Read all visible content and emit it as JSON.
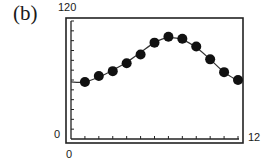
{
  "panel": {
    "label": "(b)"
  },
  "axes": {
    "y_max_label": "120",
    "y_min_label": "0",
    "x_min_label": "0",
    "x_max_label": "12"
  },
  "chart_data": {
    "type": "scatter",
    "title": "(b)",
    "xlabel": "",
    "ylabel": "",
    "xlim": [
      0,
      12
    ],
    "ylim": [
      0,
      120
    ],
    "grid": false,
    "legend": null,
    "x_ticks": [
      0,
      1,
      2,
      3,
      4,
      5,
      6,
      7,
      8,
      9,
      10,
      11,
      12
    ],
    "y_ticks_count": 12,
    "series": [
      {
        "name": "data",
        "marker": "filled-circle",
        "x": [
          1,
          2,
          3,
          4,
          5,
          6,
          7,
          8,
          9,
          10,
          11,
          12
        ],
        "values": [
          58,
          64,
          69,
          77,
          86,
          98,
          104,
          102,
          94,
          81,
          68,
          60
        ]
      },
      {
        "name": "fitted curve",
        "style": "line",
        "x": [
          0,
          1,
          2,
          3,
          4,
          5,
          6,
          7,
          8,
          9,
          10,
          11,
          12
        ],
        "values": [
          58,
          58,
          63,
          70,
          78,
          88,
          98,
          103,
          101,
          93,
          81,
          68,
          59
        ]
      }
    ]
  }
}
